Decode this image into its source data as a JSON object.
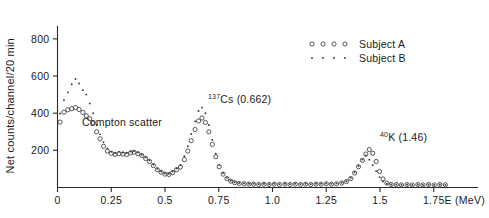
{
  "chart_data": {
    "type": "scatter",
    "title": "",
    "xlabel": "E (MeV)",
    "ylabel": "Net counts/channel/20 min",
    "xlim": [
      0,
      1.9
    ],
    "ylim": [
      0,
      880
    ],
    "grid": false,
    "legend_position": "top-right",
    "xticks": [
      "0",
      "0.25",
      "0.5",
      "0.75",
      "1.0",
      "1.25",
      "1.5",
      "1.75"
    ],
    "xtick_values": [
      0,
      0.25,
      0.5,
      0.75,
      1.0,
      1.25,
      1.5,
      1.75
    ],
    "yticks": [
      "200",
      "400",
      "600",
      "800"
    ],
    "ytick_values": [
      200,
      400,
      600,
      800
    ],
    "annotations": [
      {
        "text": "Compton scatter",
        "x": 0.3,
        "y": 330,
        "name": "compton-scatter-annotation"
      },
      {
        "text": "Cs (0.662)",
        "sup": "137",
        "x": 0.7,
        "y": 455,
        "name": "cs137-annotation"
      },
      {
        "text": "K (1.46)",
        "sup": "40",
        "x": 1.5,
        "y": 250,
        "name": "k40-annotation"
      }
    ],
    "series": [
      {
        "name": "Subject A",
        "marker": "open-circle",
        "color": "#3a3a3a",
        "points": [
          [
            0.012,
            352
          ],
          [
            0.03,
            405
          ],
          [
            0.048,
            418
          ],
          [
            0.066,
            424
          ],
          [
            0.084,
            430
          ],
          [
            0.1,
            420
          ],
          [
            0.118,
            404
          ],
          [
            0.134,
            386
          ],
          [
            0.15,
            370
          ],
          [
            0.166,
            348
          ],
          [
            0.182,
            300
          ],
          [
            0.198,
            262
          ],
          [
            0.214,
            222
          ],
          [
            0.232,
            196
          ],
          [
            0.25,
            184
          ],
          [
            0.268,
            178
          ],
          [
            0.286,
            182
          ],
          [
            0.304,
            180
          ],
          [
            0.322,
            178
          ],
          [
            0.34,
            186
          ],
          [
            0.356,
            190
          ],
          [
            0.374,
            182
          ],
          [
            0.392,
            172
          ],
          [
            0.41,
            156
          ],
          [
            0.428,
            140
          ],
          [
            0.446,
            118
          ],
          [
            0.464,
            96
          ],
          [
            0.482,
            82
          ],
          [
            0.5,
            72
          ],
          [
            0.518,
            70
          ],
          [
            0.536,
            80
          ],
          [
            0.554,
            96
          ],
          [
            0.572,
            110
          ],
          [
            0.59,
            150
          ],
          [
            0.606,
            196
          ],
          [
            0.622,
            252
          ],
          [
            0.64,
            312
          ],
          [
            0.656,
            358
          ],
          [
            0.672,
            374
          ],
          [
            0.688,
            350
          ],
          [
            0.704,
            300
          ],
          [
            0.72,
            232
          ],
          [
            0.736,
            166
          ],
          [
            0.752,
            112
          ],
          [
            0.77,
            72
          ],
          [
            0.788,
            48
          ],
          [
            0.806,
            34
          ],
          [
            0.824,
            26
          ],
          [
            0.845,
            22
          ],
          [
            0.868,
            20
          ],
          [
            0.89,
            18
          ],
          [
            0.912,
            18
          ],
          [
            0.936,
            16
          ],
          [
            0.96,
            18
          ],
          [
            0.984,
            16
          ],
          [
            1.008,
            18
          ],
          [
            1.032,
            16
          ],
          [
            1.058,
            18
          ],
          [
            1.082,
            16
          ],
          [
            1.106,
            18
          ],
          [
            1.13,
            16
          ],
          [
            1.154,
            18
          ],
          [
            1.178,
            16
          ],
          [
            1.202,
            18
          ],
          [
            1.226,
            18
          ],
          [
            1.25,
            20
          ],
          [
            1.274,
            18
          ],
          [
            1.298,
            20
          ],
          [
            1.322,
            24
          ],
          [
            1.344,
            32
          ],
          [
            1.364,
            48
          ],
          [
            1.382,
            78
          ],
          [
            1.4,
            112
          ],
          [
            1.418,
            146
          ],
          [
            1.434,
            180
          ],
          [
            1.45,
            204
          ],
          [
            1.466,
            184
          ],
          [
            1.482,
            140
          ],
          [
            1.498,
            86
          ],
          [
            1.514,
            46
          ],
          [
            1.532,
            24
          ],
          [
            1.552,
            16
          ],
          [
            1.576,
            16
          ],
          [
            1.6,
            14
          ],
          [
            1.626,
            16
          ],
          [
            1.65,
            14
          ],
          [
            1.676,
            16
          ],
          [
            1.7,
            14
          ],
          [
            1.726,
            16
          ],
          [
            1.752,
            14
          ],
          [
            1.778,
            16
          ],
          [
            1.804,
            14
          ]
        ]
      },
      {
        "name": "Subject B",
        "marker": "dot",
        "color": "#3a3a3a",
        "points": [
          [
            0.012,
            398
          ],
          [
            0.03,
            470
          ],
          [
            0.048,
            512
          ],
          [
            0.066,
            556
          ],
          [
            0.084,
            584
          ],
          [
            0.1,
            560
          ],
          [
            0.118,
            524
          ],
          [
            0.134,
            500
          ],
          [
            0.15,
            452
          ],
          [
            0.166,
            400
          ],
          [
            0.182,
            336
          ],
          [
            0.198,
            286
          ],
          [
            0.214,
            244
          ],
          [
            0.232,
            210
          ],
          [
            0.25,
            192
          ],
          [
            0.268,
            186
          ],
          [
            0.286,
            192
          ],
          [
            0.304,
            188
          ],
          [
            0.322,
            186
          ],
          [
            0.34,
            194
          ],
          [
            0.356,
            196
          ],
          [
            0.374,
            188
          ],
          [
            0.392,
            176
          ],
          [
            0.41,
            162
          ],
          [
            0.428,
            146
          ],
          [
            0.446,
            124
          ],
          [
            0.464,
            100
          ],
          [
            0.482,
            86
          ],
          [
            0.5,
            76
          ],
          [
            0.518,
            74
          ],
          [
            0.536,
            86
          ],
          [
            0.554,
            102
          ],
          [
            0.572,
            122
          ],
          [
            0.59,
            168
          ],
          [
            0.606,
            222
          ],
          [
            0.622,
            288
          ],
          [
            0.64,
            356
          ],
          [
            0.656,
            412
          ],
          [
            0.672,
            430
          ],
          [
            0.688,
            400
          ],
          [
            0.704,
            336
          ],
          [
            0.72,
            256
          ],
          [
            0.736,
            182
          ],
          [
            0.752,
            122
          ],
          [
            0.77,
            78
          ],
          [
            0.788,
            52
          ],
          [
            0.806,
            36
          ],
          [
            0.824,
            28
          ],
          [
            0.845,
            24
          ],
          [
            0.868,
            22
          ],
          [
            0.89,
            20
          ],
          [
            0.912,
            20
          ],
          [
            0.936,
            18
          ],
          [
            0.96,
            20
          ],
          [
            0.984,
            18
          ],
          [
            1.008,
            20
          ],
          [
            1.032,
            18
          ],
          [
            1.058,
            20
          ],
          [
            1.082,
            18
          ],
          [
            1.106,
            20
          ],
          [
            1.13,
            18
          ],
          [
            1.154,
            20
          ],
          [
            1.178,
            18
          ],
          [
            1.202,
            20
          ],
          [
            1.226,
            20
          ],
          [
            1.25,
            22
          ],
          [
            1.274,
            20
          ],
          [
            1.298,
            22
          ],
          [
            1.322,
            26
          ],
          [
            1.344,
            34
          ],
          [
            1.364,
            52
          ],
          [
            1.382,
            82
          ],
          [
            1.4,
            116
          ],
          [
            1.418,
            150
          ],
          [
            1.434,
            172
          ],
          [
            1.45,
            150
          ],
          [
            1.466,
            120
          ],
          [
            1.482,
            88
          ],
          [
            1.498,
            56
          ],
          [
            1.514,
            32
          ],
          [
            1.532,
            20
          ],
          [
            1.552,
            16
          ],
          [
            1.576,
            16
          ],
          [
            1.6,
            14
          ],
          [
            1.626,
            16
          ],
          [
            1.65,
            14
          ],
          [
            1.676,
            16
          ],
          [
            1.7,
            14
          ],
          [
            1.726,
            16
          ],
          [
            1.752,
            14
          ],
          [
            1.778,
            16
          ],
          [
            1.804,
            14
          ]
        ]
      }
    ]
  },
  "legend": {
    "entries": [
      {
        "label": "Subject A",
        "marker": "open-circle"
      },
      {
        "label": "Subject B",
        "marker": "dot"
      }
    ]
  }
}
